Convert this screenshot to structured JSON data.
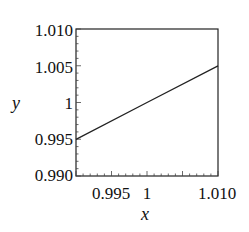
{
  "chart_data": {
    "type": "line",
    "title": "",
    "xlabel": "x",
    "ylabel": "y",
    "xlim": [
      0.99,
      1.01
    ],
    "ylim": [
      0.99,
      1.01
    ],
    "x_ticks": [
      "0.995",
      "1",
      "1.010"
    ],
    "y_ticks": [
      "1.010",
      "1.005",
      "1",
      "0.995",
      "0.990"
    ],
    "grid": false,
    "legend": null,
    "series": [
      {
        "name": "y",
        "x": [
          0.99,
          1.0,
          1.01
        ],
        "values": [
          0.995,
          1.0,
          1.005
        ],
        "color": "#222222"
      }
    ]
  },
  "labels": {
    "xlabel": "x",
    "ylabel": "y",
    "xticks": {
      "t0": "0.995",
      "t1": "1",
      "t2": "1.010"
    },
    "yticks": {
      "t0": "1.010",
      "t1": "1.005",
      "t2": "1",
      "t3": "0.995",
      "t4": "0.990"
    }
  }
}
